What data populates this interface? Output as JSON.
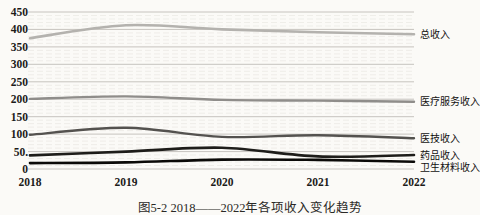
{
  "figure": {
    "caption": "图5-2 2018——2022年各项收入变化趋势"
  },
  "chart_data": {
    "type": "line",
    "title": "",
    "xlabel": "",
    "ylabel": "",
    "categories": [
      "2018",
      "2019",
      "2020",
      "2021",
      "2022"
    ],
    "yticks": [
      "450",
      "400",
      "350",
      "300",
      "250",
      "200",
      "150",
      "100",
      "50.",
      "0"
    ],
    "ytick_values": [
      450,
      400,
      350,
      300,
      250,
      200,
      150,
      100,
      50,
      0
    ],
    "ylim": [
      0,
      450
    ],
    "grid": "horizontal, major every 50 with faint minor lines every 10",
    "legend_position": "labels at right end of each line",
    "series": [
      {
        "name": "总收入",
        "values": [
          375,
          412,
          400,
          392,
          386
        ],
        "color": "#b4b2ae"
      },
      {
        "name": "医疗服务收入",
        "values": [
          201,
          208,
          198,
          196,
          193
        ],
        "color": "#8f8d8a"
      },
      {
        "name": "医技收入",
        "values": [
          98,
          118,
          92,
          97,
          88
        ],
        "color": "#54524f"
      },
      {
        "name": "药品收入",
        "values": [
          39,
          50,
          61,
          36,
          40
        ],
        "color": "#1e1d1a"
      },
      {
        "name": "卫生材料收入",
        "values": [
          17,
          19,
          27,
          26,
          21
        ],
        "color": "#0b0a08"
      }
    ]
  }
}
